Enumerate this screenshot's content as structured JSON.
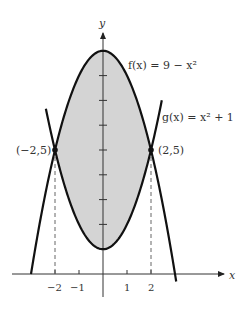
{
  "figure": {
    "type": "area-between-curves",
    "x_axis_label": "x",
    "y_axis_label": "y",
    "x_tick_labels": [
      "−2",
      "−1",
      "1",
      "2"
    ],
    "x_ticks": [
      -2,
      -1,
      1,
      2
    ],
    "y_ticks": [
      1,
      2,
      3,
      4,
      5,
      6,
      7,
      8
    ],
    "curves": [
      {
        "name": "f",
        "label": "f(x) = 9 − x²",
        "expression": "9 - x^2"
      },
      {
        "name": "g",
        "label": "g(x) = x² + 1",
        "expression": "x^2 + 1"
      }
    ],
    "intersections": [
      {
        "label": "(−2,5)",
        "x": -2,
        "y": 5
      },
      {
        "label": "(2,5)",
        "x": 2,
        "y": 5
      }
    ],
    "shaded_region": {
      "between": [
        "f",
        "g"
      ],
      "x_range": [
        -2,
        2
      ],
      "color": "#d4d4d4"
    },
    "curve_color": "#111111",
    "x_range": [
      -4.2,
      5
    ],
    "y_range": [
      -1,
      10
    ]
  },
  "labels": {
    "f_label": "f(x) = 9 − x²",
    "g_label": "g(x) = x² + 1",
    "left_point": "(−2,5)",
    "right_point": "(2,5)",
    "x": "x",
    "y": "y",
    "tick_m2": "−2",
    "tick_m1": "−1",
    "tick_1": "1",
    "tick_2": "2"
  }
}
